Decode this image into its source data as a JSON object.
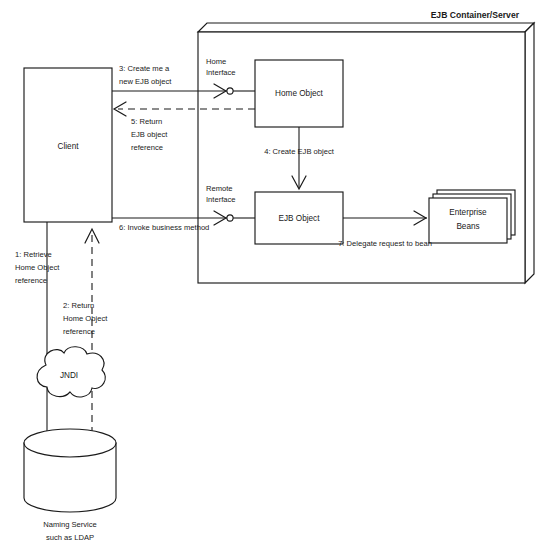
{
  "diagram": {
    "title": "EJB Container/Server",
    "nodes": {
      "client": "Client",
      "home_object": "Home Object",
      "ejb_object": "EJB Object",
      "enterprise_beans_line1": "Enterprise",
      "enterprise_beans_line2": "Beans",
      "jndi": "JNDI",
      "naming_service_line1": "Naming Service",
      "naming_service_line2": "such as LDAP"
    },
    "interfaces": {
      "home_line1": "Home",
      "home_line2": "Interface",
      "remote_line1": "Remote",
      "remote_line2": "Interface"
    },
    "steps": [
      {
        "id": "step-1",
        "lines": [
          "1: Retrieve",
          "Home Object",
          "reference"
        ],
        "style": "solid"
      },
      {
        "id": "step-2",
        "lines": [
          "2: Return",
          "Home Object",
          "reference"
        ],
        "style": "dashed"
      },
      {
        "id": "step-3",
        "lines": [
          "3: Create me a",
          "new EJB object"
        ],
        "style": "solid"
      },
      {
        "id": "step-4",
        "lines": [
          "4: Create EJB object"
        ],
        "style": "solid"
      },
      {
        "id": "step-5",
        "lines": [
          "5: Return",
          "EJB object",
          "reference"
        ],
        "style": "dashed"
      },
      {
        "id": "step-6",
        "lines": [
          "6: Invoke business method"
        ],
        "style": "solid"
      },
      {
        "id": "step-7",
        "lines": [
          "7: Delegate request to bean"
        ],
        "style": "solid"
      }
    ],
    "colors": {
      "stroke": "#1a1a1a",
      "fill": "#ffffff",
      "background": "#ffffff"
    }
  }
}
